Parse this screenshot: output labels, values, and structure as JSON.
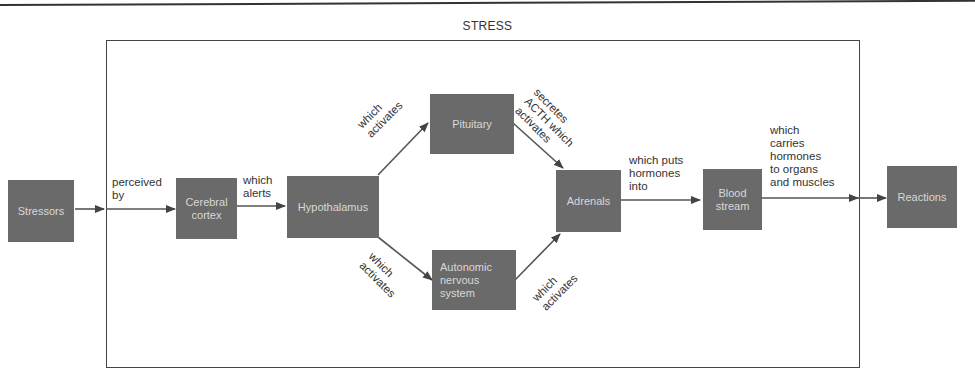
{
  "title": "STRESS",
  "nodes": {
    "stressors": "Stressors",
    "cerebral_cortex": "Cerebral\ncortex",
    "hypothalamus": "Hypothalamus",
    "pituitary": "Pituitary",
    "autonomic": "Autonomic\nnervous\nsystem",
    "adrenals": "Adrenals",
    "blood_stream": "Blood\nstream",
    "reactions": "Reactions"
  },
  "edges": {
    "perceived_by": "perceived\nby",
    "which_alerts": "which\nalerts",
    "hypo_to_pit": "which\nactivates",
    "hypo_to_ans": "which\nactivates",
    "pit_to_adr": "secretes\nACTH which\nactivates",
    "ans_to_adr": "which\nactivates",
    "adr_to_blood": "which puts\nhormones\ninto",
    "blood_to_reactions": "which\ncarries\nhormones\nto organs\nand muscles"
  },
  "colors": {
    "node_fill": "#6a6a6a",
    "node_text": "#d8d8d8",
    "line": "#444444"
  }
}
